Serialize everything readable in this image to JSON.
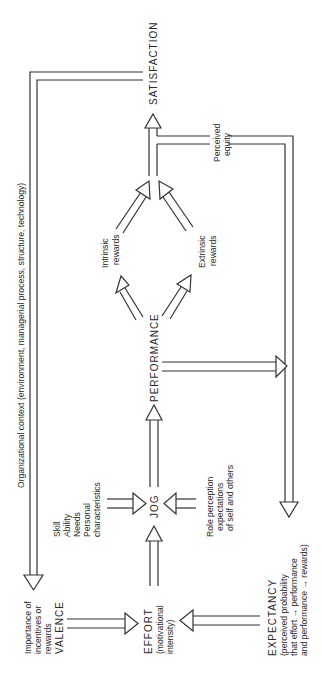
{
  "diagram": {
    "orientation": "rotated 90deg counter-clockwise",
    "context_label": "Organizational context (environment, managerial process, structure, technology)",
    "nodes": {
      "satisfaction": "SATISFACTION",
      "performance": "PERFORMANCE",
      "job": "JOG",
      "effort": {
        "title": "EFFORT",
        "line1": "(motivational",
        "line2": "intensity)"
      },
      "valence": {
        "line1": "Importance of",
        "line2": "incentives or",
        "line3": "rewards",
        "title": "VALENCE"
      },
      "expectancy": {
        "title": "EXPECTANCY",
        "line1": "(perceived probability",
        "line2": "that effort → performance",
        "line3": "and performance → rewards)"
      },
      "abilities": {
        "line1": "Skill",
        "line2": "Ability",
        "line3": "Needs",
        "line4": "Personal",
        "line5": "characteristics"
      },
      "role": {
        "line1": "Role perception",
        "line2": "expectations",
        "line3": "of self and others"
      },
      "intrinsic": {
        "line1": "Intrinsic",
        "line2": "rewards"
      },
      "extrinsic": {
        "line1": "Extrinsic",
        "line2": "rewards"
      },
      "equity": {
        "line1": "Perceived",
        "line2": "equity"
      }
    },
    "edges": [
      {
        "from": "VALENCE",
        "to": "EFFORT"
      },
      {
        "from": "EXPECTANCY",
        "to": "EFFORT"
      },
      {
        "from": "EFFORT",
        "to": "JOB"
      },
      {
        "from": "Skill/Ability/Needs/Personal characteristics",
        "to": "JOB"
      },
      {
        "from": "Role perception",
        "to": "JOB"
      },
      {
        "from": "JOB",
        "to": "PERFORMANCE"
      },
      {
        "from": "PERFORMANCE",
        "to": "Intrinsic rewards"
      },
      {
        "from": "PERFORMANCE",
        "to": "Extrinsic rewards"
      },
      {
        "from": "Intrinsic rewards",
        "to": "SATISFACTION"
      },
      {
        "from": "Extrinsic rewards",
        "to": "SATISFACTION"
      },
      {
        "from": "PERFORMANCE",
        "to": "EXPECTANCY"
      },
      {
        "from": "Perceived equity",
        "to": "EXPECTANCY"
      },
      {
        "from": "SATISFACTION",
        "to": "VALENCE",
        "via": "Organizational context"
      }
    ],
    "colors": {
      "line": "#333333",
      "text": "#2a2a2a",
      "background": "#ffffff"
    }
  }
}
